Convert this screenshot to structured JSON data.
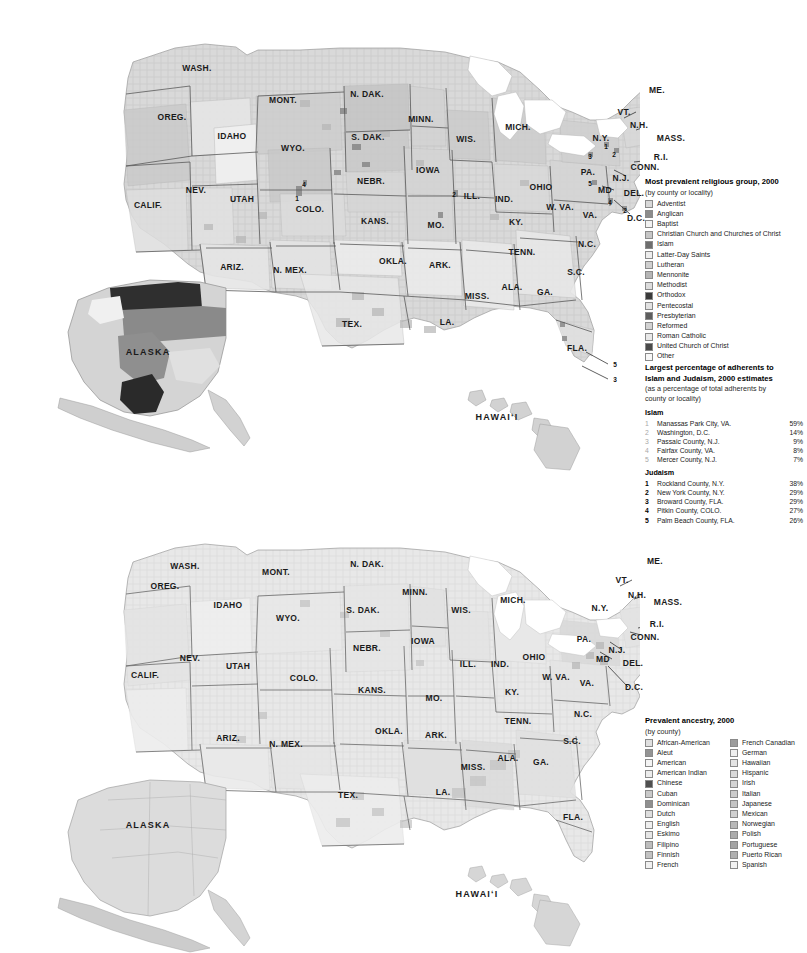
{
  "maps": [
    {
      "id": "religion",
      "inset_labels": [
        {
          "text": "ALASKA",
          "x": 148,
          "y": 352
        },
        {
          "text": "HAWAIʻI",
          "x": 497,
          "y": 417
        }
      ],
      "state_labels": [
        {
          "text": "WASH.",
          "x": 197,
          "y": 68
        },
        {
          "text": "OREG.",
          "x": 172,
          "y": 117
        },
        {
          "text": "IDAHO",
          "x": 232,
          "y": 136
        },
        {
          "text": "MONT.",
          "x": 283,
          "y": 100
        },
        {
          "text": "N. DAK.",
          "x": 367,
          "y": 94
        },
        {
          "text": "S. DAK.",
          "x": 368,
          "y": 137
        },
        {
          "text": "MINN.",
          "x": 421,
          "y": 119
        },
        {
          "text": "WIS.",
          "x": 466,
          "y": 139
        },
        {
          "text": "MICH.",
          "x": 518,
          "y": 127
        },
        {
          "text": "WYO.",
          "x": 293,
          "y": 148
        },
        {
          "text": "NEBR.",
          "x": 371,
          "y": 181
        },
        {
          "text": "IOWA",
          "x": 428,
          "y": 170
        },
        {
          "text": "NEV.",
          "x": 196,
          "y": 190
        },
        {
          "text": "UTAH",
          "x": 242,
          "y": 199
        },
        {
          "text": "COLO.",
          "x": 310,
          "y": 209
        },
        {
          "text": "CALIF.",
          "x": 148,
          "y": 205
        },
        {
          "text": "KANS.",
          "x": 375,
          "y": 221
        },
        {
          "text": "MO.",
          "x": 436,
          "y": 225
        },
        {
          "text": "ILL.",
          "x": 472,
          "y": 196
        },
        {
          "text": "IND.",
          "x": 504,
          "y": 199
        },
        {
          "text": "OHIO",
          "x": 541,
          "y": 187
        },
        {
          "text": "PA.",
          "x": 588,
          "y": 172
        },
        {
          "text": "N.Y.",
          "x": 601,
          "y": 138
        },
        {
          "text": "VT.",
          "x": 624,
          "y": 112
        },
        {
          "text": "N.H.",
          "x": 639,
          "y": 125
        },
        {
          "text": "ME.",
          "x": 657,
          "y": 90
        },
        {
          "text": "MASS.",
          "x": 671,
          "y": 138
        },
        {
          "text": "R.I.",
          "x": 661,
          "y": 157
        },
        {
          "text": "CONN.",
          "x": 645,
          "y": 167
        },
        {
          "text": "N.J.",
          "x": 621,
          "y": 178
        },
        {
          "text": "MD",
          "x": 605,
          "y": 190
        },
        {
          "text": "DEL.",
          "x": 634,
          "y": 193
        },
        {
          "text": "D.C.",
          "x": 636,
          "y": 218
        },
        {
          "text": "W. VA.",
          "x": 560,
          "y": 207
        },
        {
          "text": "VA.",
          "x": 590,
          "y": 215
        },
        {
          "text": "KY.",
          "x": 516,
          "y": 222
        },
        {
          "text": "TENN.",
          "x": 522,
          "y": 252
        },
        {
          "text": "N.C.",
          "x": 587,
          "y": 244
        },
        {
          "text": "S.C.",
          "x": 576,
          "y": 272
        },
        {
          "text": "GA.",
          "x": 545,
          "y": 292
        },
        {
          "text": "ALA.",
          "x": 512,
          "y": 287
        },
        {
          "text": "MISS.",
          "x": 477,
          "y": 296
        },
        {
          "text": "ARK.",
          "x": 440,
          "y": 265
        },
        {
          "text": "OKLA.",
          "x": 393,
          "y": 261
        },
        {
          "text": "TEX.",
          "x": 352,
          "y": 324
        },
        {
          "text": "LA.",
          "x": 447,
          "y": 322
        },
        {
          "text": "N. MEX.",
          "x": 290,
          "y": 270
        },
        {
          "text": "ARIZ.",
          "x": 232,
          "y": 267
        },
        {
          "text": "FLA.",
          "x": 577,
          "y": 348
        }
      ],
      "markers": [
        {
          "text": "1",
          "x": 606,
          "y": 146
        },
        {
          "text": "3",
          "x": 590,
          "y": 156
        },
        {
          "text": "2",
          "x": 614,
          "y": 154
        },
        {
          "text": "5",
          "x": 590,
          "y": 183
        },
        {
          "text": "4",
          "x": 304,
          "y": 184
        },
        {
          "text": "1",
          "x": 297,
          "y": 198
        },
        {
          "text": "4",
          "x": 610,
          "y": 202
        },
        {
          "text": "2",
          "x": 625,
          "y": 210
        },
        {
          "text": "5",
          "x": 615,
          "y": 364
        },
        {
          "text": "3",
          "x": 615,
          "y": 379
        },
        {
          "text": "2",
          "x": 454,
          "y": 194
        }
      ]
    },
    {
      "id": "ancestry",
      "inset_labels": [
        {
          "text": "ALASKA",
          "x": 148,
          "y": 825
        },
        {
          "text": "HAWAIʻI",
          "x": 477,
          "y": 894
        }
      ],
      "state_labels": [
        {
          "text": "WASH.",
          "x": 185,
          "y": 566
        },
        {
          "text": "OREG.",
          "x": 165,
          "y": 586
        },
        {
          "text": "IDAHO",
          "x": 228,
          "y": 605
        },
        {
          "text": "MONT.",
          "x": 276,
          "y": 572
        },
        {
          "text": "N. DAK.",
          "x": 367,
          "y": 564
        },
        {
          "text": "S. DAK.",
          "x": 363,
          "y": 610
        },
        {
          "text": "MINN.",
          "x": 415,
          "y": 592
        },
        {
          "text": "WIS.",
          "x": 461,
          "y": 610
        },
        {
          "text": "MICH.",
          "x": 513,
          "y": 600
        },
        {
          "text": "WYO.",
          "x": 288,
          "y": 618
        },
        {
          "text": "NEBR.",
          "x": 367,
          "y": 648
        },
        {
          "text": "IOWA",
          "x": 423,
          "y": 641
        },
        {
          "text": "NEV.",
          "x": 190,
          "y": 658
        },
        {
          "text": "UTAH",
          "x": 238,
          "y": 666
        },
        {
          "text": "COLO.",
          "x": 304,
          "y": 678
        },
        {
          "text": "CALIF.",
          "x": 145,
          "y": 675
        },
        {
          "text": "KANS.",
          "x": 372,
          "y": 690
        },
        {
          "text": "MO.",
          "x": 434,
          "y": 698
        },
        {
          "text": "ILL.",
          "x": 468,
          "y": 664
        },
        {
          "text": "IND.",
          "x": 500,
          "y": 664
        },
        {
          "text": "OHIO",
          "x": 534,
          "y": 657
        },
        {
          "text": "PA.",
          "x": 584,
          "y": 639
        },
        {
          "text": "N.Y.",
          "x": 600,
          "y": 608
        },
        {
          "text": "VT.",
          "x": 622,
          "y": 580
        },
        {
          "text": "N.H.",
          "x": 637,
          "y": 595
        },
        {
          "text": "ME.",
          "x": 655,
          "y": 561
        },
        {
          "text": "MASS.",
          "x": 668,
          "y": 602
        },
        {
          "text": "R.I.",
          "x": 657,
          "y": 624
        },
        {
          "text": "CONN.",
          "x": 645,
          "y": 637
        },
        {
          "text": "N.J.",
          "x": 617,
          "y": 650
        },
        {
          "text": "MD",
          "x": 603,
          "y": 659
        },
        {
          "text": "DEL.",
          "x": 633,
          "y": 663
        },
        {
          "text": "D.C.",
          "x": 634,
          "y": 687
        },
        {
          "text": "W. VA.",
          "x": 556,
          "y": 677
        },
        {
          "text": "VA.",
          "x": 587,
          "y": 683
        },
        {
          "text": "KY.",
          "x": 512,
          "y": 692
        },
        {
          "text": "TENN.",
          "x": 518,
          "y": 721
        },
        {
          "text": "N.C.",
          "x": 583,
          "y": 714
        },
        {
          "text": "S.C.",
          "x": 572,
          "y": 741
        },
        {
          "text": "GA.",
          "x": 541,
          "y": 762
        },
        {
          "text": "ALA.",
          "x": 508,
          "y": 758
        },
        {
          "text": "MISS.",
          "x": 473,
          "y": 767
        },
        {
          "text": "ARK.",
          "x": 436,
          "y": 735
        },
        {
          "text": "OKLA.",
          "x": 389,
          "y": 731
        },
        {
          "text": "TEX.",
          "x": 348,
          "y": 795
        },
        {
          "text": "LA.",
          "x": 443,
          "y": 792
        },
        {
          "text": "N. MEX.",
          "x": 286,
          "y": 744
        },
        {
          "text": "ARIZ.",
          "x": 228,
          "y": 738
        },
        {
          "text": "FLA.",
          "x": 573,
          "y": 817
        }
      ],
      "markers": []
    }
  ],
  "legend_religion": {
    "title": "Most prevalent religious group, 2000",
    "subtitle": "(by county or locality)",
    "items": [
      {
        "label": "Adventist",
        "color": "#d8d8d8"
      },
      {
        "label": "Anglican",
        "color": "#8c8c8c"
      },
      {
        "label": "Baptist",
        "color": "#f2f2f2"
      },
      {
        "label": "Christian Church and Churches of Christ",
        "color": "#c6c6c6"
      },
      {
        "label": "Islam",
        "color": "#6e6e6e"
      },
      {
        "label": "Latter-Day Saints",
        "color": "#ededed"
      },
      {
        "label": "Lutheran",
        "color": "#cfcfcf"
      },
      {
        "label": "Mennonite",
        "color": "#b5b5b5"
      },
      {
        "label": "Methodist",
        "color": "#dcdcdc"
      },
      {
        "label": "Orthodox",
        "color": "#3a3a3a"
      },
      {
        "label": "Pentecostal",
        "color": "#e2e2e2"
      },
      {
        "label": "Presbyterian",
        "color": "#5e5e5e"
      },
      {
        "label": "Reformed",
        "color": "#d2d2d2"
      },
      {
        "label": "Roman Catholic",
        "color": "#e8e8e8"
      },
      {
        "label": "United Church of Christ",
        "color": "#4a4a4a"
      },
      {
        "label": "Other",
        "color": "#f7f7f7"
      }
    ]
  },
  "legend_ml": {
    "title_line1": "Largest percentage of adherents to",
    "title_line2": "Islam and Judaism, 2000 estimates",
    "subtitle_line1": "(as a percentage of total adherents by",
    "subtitle_line2": "county or locality)",
    "groups": [
      {
        "name": "Islam",
        "number_style": "light",
        "rows": [
          {
            "rank": "1",
            "place": "Manassas Park City, VA.",
            "pct": "59%"
          },
          {
            "rank": "2",
            "place": "Washington, D.C.",
            "pct": "14%"
          },
          {
            "rank": "3",
            "place": "Passaic County, N.J.",
            "pct": "9%"
          },
          {
            "rank": "4",
            "place": "Fairfax County, VA.",
            "pct": "8%"
          },
          {
            "rank": "5",
            "place": "Mercer County, N.J.",
            "pct": "7%"
          }
        ]
      },
      {
        "name": "Judaism",
        "number_style": "dark",
        "rows": [
          {
            "rank": "1",
            "place": "Rockland County, N.Y.",
            "pct": "38%"
          },
          {
            "rank": "2",
            "place": "New York County, N.Y.",
            "pct": "29%"
          },
          {
            "rank": "3",
            "place": "Broward County, FLA.",
            "pct": "29%"
          },
          {
            "rank": "4",
            "place": "Pitkin County, COLO.",
            "pct": "27%"
          },
          {
            "rank": "5",
            "place": "Palm Beach County, FLA.",
            "pct": "26%"
          }
        ]
      }
    ]
  },
  "legend_ancestry": {
    "title": "Prevalent ancestry, 2000",
    "subtitle": "(by county)",
    "column_left": [
      {
        "label": "African-American",
        "color": "#e0e0e0"
      },
      {
        "label": "Aleut",
        "color": "#949494"
      },
      {
        "label": "American",
        "color": "#f4f4f4"
      },
      {
        "label": "American Indian",
        "color": "#ececec"
      },
      {
        "label": "Chinese",
        "color": "#4f4f4f"
      },
      {
        "label": "Cuban",
        "color": "#c9c9c9"
      },
      {
        "label": "Dominican",
        "color": "#8f8f8f"
      },
      {
        "label": "Dutch",
        "color": "#dedede"
      },
      {
        "label": "English",
        "color": "#efefef"
      },
      {
        "label": "Eskimo",
        "color": "#e6e6e6"
      },
      {
        "label": "Filipino",
        "color": "#bdbdbd"
      },
      {
        "label": "Finnish",
        "color": "#c2c2c2"
      },
      {
        "label": "French",
        "color": "#f0f0f0"
      }
    ],
    "column_right": [
      {
        "label": "French Canadian",
        "color": "#9c9c9c"
      },
      {
        "label": "German",
        "color": "#eeeeee"
      },
      {
        "label": "Hawaiian",
        "color": "#e4e4e4"
      },
      {
        "label": "Hispanic",
        "color": "#dadada"
      },
      {
        "label": "Irish",
        "color": "#d4d4d4"
      },
      {
        "label": "Italian",
        "color": "#cccccc"
      },
      {
        "label": "Japanese",
        "color": "#c4c4c4"
      },
      {
        "label": "Mexican",
        "color": "#d0d0d0"
      },
      {
        "label": "Norwegian",
        "color": "#b8b8b8"
      },
      {
        "label": "Polish",
        "color": "#ababab"
      },
      {
        "label": "Portuguese",
        "color": "#a4a4a4"
      },
      {
        "label": "Puerto Rican",
        "color": "#b0b0b0"
      },
      {
        "label": "Spanish",
        "color": "#f2f2f2"
      }
    ]
  }
}
